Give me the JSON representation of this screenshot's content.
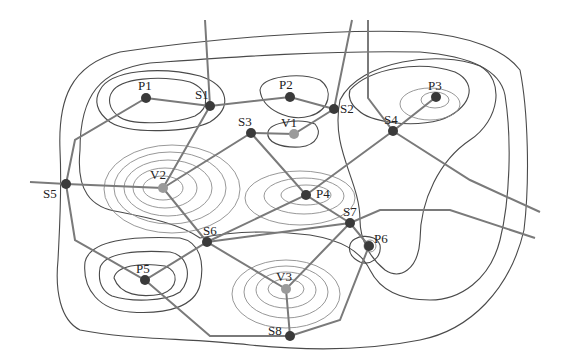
{
  "diagram": {
    "type": "contour map with graph overlay (peaks, valleys, saddles)",
    "nodes": [
      {
        "id": "P1",
        "kind": "peak",
        "x": 146,
        "y": 98
      },
      {
        "id": "P2",
        "kind": "peak",
        "x": 290,
        "y": 97
      },
      {
        "id": "P3",
        "kind": "peak",
        "x": 436,
        "y": 97
      },
      {
        "id": "P4",
        "kind": "peak",
        "x": 306,
        "y": 195
      },
      {
        "id": "P5",
        "kind": "peak",
        "x": 145,
        "y": 280
      },
      {
        "id": "P6",
        "kind": "peak",
        "x": 369,
        "y": 246
      },
      {
        "id": "V1",
        "kind": "valley",
        "x": 294,
        "y": 134
      },
      {
        "id": "V2",
        "kind": "valley",
        "x": 163,
        "y": 188
      },
      {
        "id": "V3",
        "kind": "valley",
        "x": 286,
        "y": 289
      },
      {
        "id": "S1",
        "kind": "saddle",
        "x": 210,
        "y": 106
      },
      {
        "id": "S2",
        "kind": "saddle",
        "x": 334,
        "y": 109
      },
      {
        "id": "S3",
        "kind": "saddle",
        "x": 251,
        "y": 133
      },
      {
        "id": "S4",
        "kind": "saddle",
        "x": 393,
        "y": 131
      },
      {
        "id": "S5",
        "kind": "saddle",
        "x": 66,
        "y": 184
      },
      {
        "id": "S6",
        "kind": "saddle",
        "x": 207,
        "y": 242
      },
      {
        "id": "S7",
        "kind": "saddle",
        "x": 350,
        "y": 223
      },
      {
        "id": "S8",
        "kind": "saddle",
        "x": 290,
        "y": 336
      }
    ],
    "labels": {
      "P1": "P1",
      "P2": "P2",
      "P3": "P3",
      "P4": "P4",
      "P5": "P5",
      "P6": "P6",
      "V1": "V1",
      "V2": "V2",
      "V3": "V3",
      "S1": "S1",
      "S2": "S2",
      "S3": "S3",
      "S4": "S4",
      "S5": "S5",
      "S6": "S6",
      "S7": "S7",
      "S8": "S8"
    },
    "colors": {
      "peak_node": "#3a3a3a",
      "saddle_node": "#3a3a3a",
      "valley_node": "#9a9a9a",
      "edge": "#7a7a7a",
      "dark_contour": "#4a4a4a",
      "light_contour": "#8c8c8c"
    }
  }
}
